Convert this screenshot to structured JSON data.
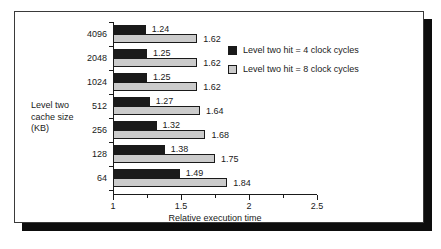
{
  "chart_data": {
    "type": "bar",
    "orientation": "horizontal",
    "title": "",
    "xlabel": "Relative execution time",
    "ylabel": "Level two cache size (KB)",
    "ylabel_lines": [
      "Level two",
      "cache size",
      "(KB)"
    ],
    "categories": [
      "4096",
      "2048",
      "1024",
      "512",
      "256",
      "128",
      "64"
    ],
    "xlim": [
      1,
      2.5
    ],
    "xticks": [
      1,
      1.5,
      2,
      2.5
    ],
    "xtick_labels": [
      "1",
      "1.5",
      "2",
      "2.5"
    ],
    "xminor_ticks": [
      1.25,
      1.75,
      2.25
    ],
    "grid": false,
    "legend_position": "upper right",
    "series": [
      {
        "name": "Level two hit = 4 clock cycles",
        "color": "#1a1a1a",
        "values": [
          1.24,
          1.25,
          1.25,
          1.27,
          1.32,
          1.38,
          1.49
        ],
        "labels": [
          "1.24",
          "1.25",
          "1.25",
          "1.27",
          "1.32",
          "1.38",
          "1.49"
        ]
      },
      {
        "name": "Level two hit = 8 clock cycles",
        "color": "#cbcbcb",
        "values": [
          1.62,
          1.62,
          1.62,
          1.64,
          1.68,
          1.75,
          1.84
        ],
        "labels": [
          "1.62",
          "1.62",
          "1.62",
          "1.64",
          "1.68",
          "1.75",
          "1.84"
        ]
      }
    ]
  },
  "legend": {
    "items": [
      {
        "label": "Level two hit = 4 clock cycles",
        "swatch": "black-swatch"
      },
      {
        "label": "Level two hit = 8 clock cycles",
        "swatch": "grey-swatch"
      }
    ]
  },
  "axes": {
    "x_title": "Relative execution time",
    "y_title_line1": "Level two",
    "y_title_line2": "cache size",
    "y_title_line3": "(KB)"
  },
  "colors": {
    "series_4_cycles": "#1a1a1a",
    "series_8_cycles": "#cbcbcb",
    "axis": "#1a1a1a",
    "frame": "#3a3a3a",
    "shadow": "#0d0d0d",
    "background": "#ffffff"
  }
}
